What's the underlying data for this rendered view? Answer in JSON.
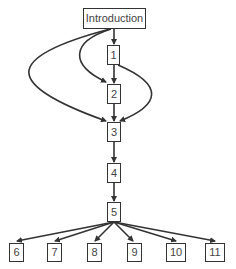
{
  "diagram": {
    "type": "flowchart",
    "colors": {
      "stroke": "#333333",
      "text": "#444444",
      "background": "#ffffff"
    },
    "nodes": [
      {
        "id": "intro",
        "label": "Introduction",
        "x": 83,
        "y": 8,
        "w": 63,
        "h": 21
      },
      {
        "id": "n1",
        "label": "1",
        "x": 107,
        "y": 45,
        "w": 13,
        "h": 20
      },
      {
        "id": "n2",
        "label": "2",
        "x": 107,
        "y": 84,
        "w": 14,
        "h": 20
      },
      {
        "id": "n3",
        "label": "3",
        "x": 107,
        "y": 122,
        "w": 14,
        "h": 20
      },
      {
        "id": "n4",
        "label": "4",
        "x": 107,
        "y": 163,
        "w": 14,
        "h": 20
      },
      {
        "id": "n5",
        "label": "5",
        "x": 107,
        "y": 202,
        "w": 14,
        "h": 20
      },
      {
        "id": "n6",
        "label": "6",
        "x": 9,
        "y": 243,
        "w": 15,
        "h": 19
      },
      {
        "id": "n7",
        "label": "7",
        "x": 47,
        "y": 243,
        "w": 15,
        "h": 19
      },
      {
        "id": "n8",
        "label": "8",
        "x": 87,
        "y": 243,
        "w": 15,
        "h": 19
      },
      {
        "id": "n9",
        "label": "9",
        "x": 127,
        "y": 243,
        "w": 15,
        "h": 19
      },
      {
        "id": "n10",
        "label": "10",
        "x": 166,
        "y": 243,
        "w": 20,
        "h": 19
      },
      {
        "id": "n11",
        "label": "11",
        "x": 205,
        "y": 243,
        "w": 20,
        "h": 19
      }
    ],
    "edges": [
      {
        "from": "Introduction",
        "to": "1"
      },
      {
        "from": "Introduction",
        "to": "2"
      },
      {
        "from": "Introduction",
        "to": "3"
      },
      {
        "from": "1",
        "to": "2"
      },
      {
        "from": "1",
        "to": "3"
      },
      {
        "from": "2",
        "to": "3"
      },
      {
        "from": "3",
        "to": "4"
      },
      {
        "from": "4",
        "to": "5"
      },
      {
        "from": "5",
        "to": "6"
      },
      {
        "from": "5",
        "to": "7"
      },
      {
        "from": "5",
        "to": "8"
      },
      {
        "from": "5",
        "to": "9"
      },
      {
        "from": "5",
        "to": "10"
      },
      {
        "from": "5",
        "to": "11"
      }
    ]
  }
}
